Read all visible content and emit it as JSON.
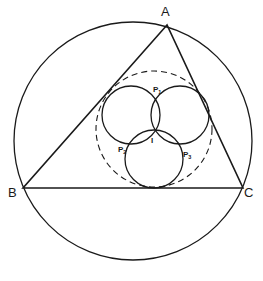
{
  "diagram": {
    "type": "geometry",
    "colors": {
      "stroke": "#1a1a1a",
      "background": "#ffffff"
    },
    "vertices": {
      "A": {
        "label": "A",
        "x": 167,
        "y": 25
      },
      "B": {
        "label": "B",
        "x": 23,
        "y": 188
      },
      "C": {
        "label": "C",
        "x": 243,
        "y": 188
      }
    },
    "circumcircle": {
      "cx": 133,
      "cy": 141,
      "r": 119
    },
    "dashed_circle": {
      "cx": 154,
      "cy": 129,
      "r": 58
    },
    "small_circles": [
      {
        "cx": 131,
        "cy": 115,
        "r": 29
      },
      {
        "cx": 180,
        "cy": 115,
        "r": 29
      },
      {
        "cx": 154,
        "cy": 159,
        "r": 29
      }
    ],
    "points": {
      "I": {
        "label": "I",
        "x": 154,
        "y": 132
      },
      "P1": {
        "label": "P",
        "sub": "1",
        "x": 156,
        "y": 92
      },
      "P2": {
        "label": "P",
        "sub": "2",
        "x": 118,
        "y": 151
      },
      "P3": {
        "label": "P",
        "sub": "3",
        "x": 184,
        "y": 157
      }
    }
  }
}
